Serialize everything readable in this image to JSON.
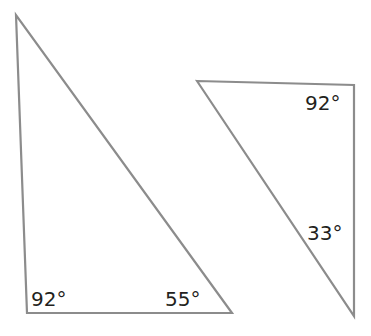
{
  "colors": {
    "stroke": "#8c8c8c",
    "text": "#231f20",
    "background": "#ffffff"
  },
  "triangles": [
    {
      "points": "16,15 27,313 232,313",
      "angles": [
        {
          "label": "92°",
          "x": 31,
          "y": 306
        },
        {
          "label": "55°",
          "x": 165,
          "y": 306
        }
      ]
    },
    {
      "points": "197,81 354,85 354,316",
      "angles": [
        {
          "label": "92°",
          "x": 305,
          "y": 110
        },
        {
          "label": "33°",
          "x": 307,
          "y": 240
        }
      ]
    }
  ]
}
